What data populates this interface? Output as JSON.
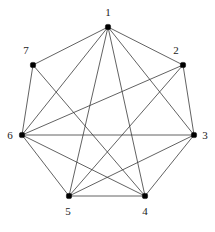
{
  "figure": {
    "background_color": "#ffffff",
    "edge_color": "#3a3a3a",
    "vertex_color": "#000000",
    "label_color": "#1a1a1a",
    "width": 215,
    "height": 232
  },
  "chart_data": {
    "type": "diagram",
    "subtype": "node-link-graph",
    "title": "",
    "directed": false,
    "node_count": 7,
    "edge_count": 17,
    "layout": "circular",
    "nodes": [
      {
        "id": "1",
        "label": "1",
        "x": 108,
        "y": 27,
        "label_x": 108,
        "label_y": 13,
        "degree": 6
      },
      {
        "id": "2",
        "label": "2",
        "x": 183,
        "y": 65,
        "label_x": 176,
        "label_y": 51,
        "degree": 4
      },
      {
        "id": "3",
        "label": "3",
        "x": 194,
        "y": 135,
        "label_x": 205,
        "label_y": 136,
        "degree": 5
      },
      {
        "id": "4",
        "label": "4",
        "x": 145,
        "y": 196,
        "label_x": 145,
        "label_y": 212,
        "degree": 6
      },
      {
        "id": "5",
        "label": "5",
        "x": 69,
        "y": 196,
        "label_x": 68,
        "label_y": 212,
        "degree": 5
      },
      {
        "id": "6",
        "label": "6",
        "x": 22,
        "y": 135,
        "label_x": 10,
        "label_y": 136,
        "degree": 6
      },
      {
        "id": "7",
        "label": "7",
        "x": 33,
        "y": 65,
        "label_x": 26,
        "label_y": 51,
        "degree": 3
      }
    ],
    "edges": [
      {
        "source": "1",
        "target": "2"
      },
      {
        "source": "1",
        "target": "3"
      },
      {
        "source": "1",
        "target": "4"
      },
      {
        "source": "1",
        "target": "5"
      },
      {
        "source": "1",
        "target": "6"
      },
      {
        "source": "1",
        "target": "7"
      },
      {
        "source": "2",
        "target": "3"
      },
      {
        "source": "2",
        "target": "5"
      },
      {
        "source": "2",
        "target": "6"
      },
      {
        "source": "3",
        "target": "4"
      },
      {
        "source": "3",
        "target": "5"
      },
      {
        "source": "3",
        "target": "6"
      },
      {
        "source": "4",
        "target": "5"
      },
      {
        "source": "4",
        "target": "6"
      },
      {
        "source": "4",
        "target": "7"
      },
      {
        "source": "5",
        "target": "6"
      },
      {
        "source": "6",
        "target": "7"
      }
    ]
  }
}
